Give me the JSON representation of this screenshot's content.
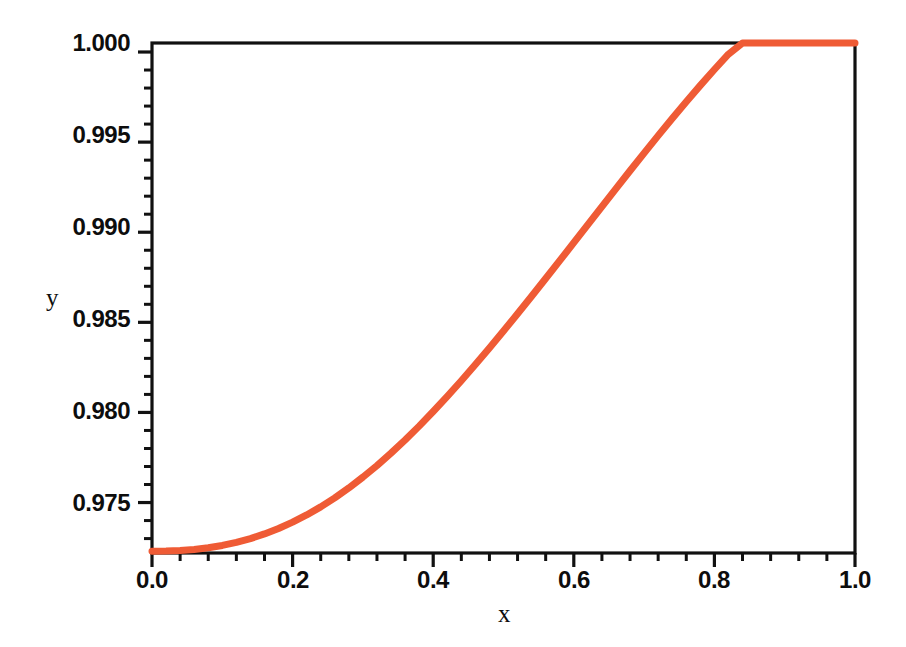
{
  "chart_data": {
    "type": "line",
    "title": "",
    "subtitle": "",
    "xlabel": "x",
    "ylabel": "y",
    "xlim": [
      0.0,
      1.0
    ],
    "ylim": [
      0.9722,
      1.0005
    ],
    "grid": false,
    "legend": null,
    "line_color": "#ef5b35",
    "line_width": 7,
    "axis_color": "#111111",
    "background": "#ffffff",
    "xticks": [
      0.0,
      0.2,
      0.4,
      0.6,
      0.8,
      1.0
    ],
    "xtick_labels": [
      "0.0",
      "0.2",
      "0.4",
      "0.6",
      "0.8",
      "1.0"
    ],
    "xminor_count": 4,
    "yticks": [
      0.975,
      0.98,
      0.985,
      0.99,
      0.995,
      1.0
    ],
    "ytick_labels": [
      "0.975",
      "0.980",
      "0.985",
      "0.990",
      "0.995",
      "1.000"
    ],
    "yminor_count": 4,
    "series": [
      {
        "name": "curve",
        "color": "#ef5b35",
        "x": [
          0.0,
          0.02,
          0.04,
          0.06,
          0.08,
          0.1,
          0.12,
          0.14,
          0.16,
          0.18,
          0.2,
          0.22,
          0.24,
          0.26,
          0.28,
          0.3,
          0.32,
          0.34,
          0.36,
          0.38,
          0.4,
          0.42,
          0.44,
          0.46,
          0.48,
          0.5,
          0.52,
          0.54,
          0.56,
          0.58,
          0.6,
          0.62,
          0.64,
          0.66,
          0.68,
          0.7,
          0.72,
          0.74,
          0.76,
          0.78,
          0.8,
          0.82,
          0.84,
          0.86,
          0.88,
          0.9,
          0.92,
          0.94,
          0.96,
          0.98,
          1.0
        ],
        "y": [
          0.9723,
          0.97231,
          0.97234,
          0.9724,
          0.97249,
          0.97262,
          0.97279,
          0.973,
          0.97326,
          0.97356,
          0.97391,
          0.97431,
          0.97476,
          0.97526,
          0.97581,
          0.97641,
          0.97705,
          0.97774,
          0.97847,
          0.97924,
          0.98005,
          0.98089,
          0.98176,
          0.98266,
          0.98358,
          0.98452,
          0.98548,
          0.98645,
          0.98743,
          0.98842,
          0.98942,
          0.99042,
          0.99142,
          0.99242,
          0.99341,
          0.99439,
          0.99536,
          0.99631,
          0.99724,
          0.99815,
          0.99903,
          0.99988,
          1.0007,
          1.00148,
          1.00222,
          1.00292,
          1.00357,
          1.00417,
          1.00471,
          1.00519,
          1.0056
        ]
      }
    ],
    "annotations": []
  },
  "axes": {
    "y_title": "y",
    "x_title": "x"
  }
}
